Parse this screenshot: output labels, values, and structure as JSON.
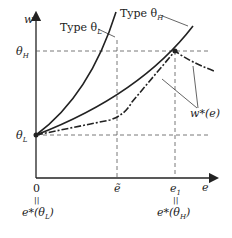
{
  "diagram": {
    "axes": {
      "y_label": "w",
      "x_label": "e",
      "origin_label": "0"
    },
    "y_ticks": [
      {
        "name": "theta-H",
        "symbol": "θ",
        "sub": "H"
      },
      {
        "name": "theta-L",
        "symbol": "θ",
        "sub": "L"
      }
    ],
    "x_ticks": [
      {
        "name": "zero",
        "label": "0",
        "equals": "||",
        "below": "e*(θ",
        "below_sub": "L",
        "below_close": ")"
      },
      {
        "name": "e-tilde",
        "label": "ẽ"
      },
      {
        "name": "e-1",
        "label": "e",
        "label_sub": "1",
        "equals": "||",
        "below": "e*(θ",
        "below_sub": "H",
        "below_close": ")"
      }
    ],
    "curves": [
      {
        "name": "type-theta-L",
        "label_prefix": "Type θ",
        "label_sub": "L",
        "style": "solid"
      },
      {
        "name": "type-theta-H",
        "label_prefix": "Type θ",
        "label_sub": "H",
        "style": "solid"
      },
      {
        "name": "w-star",
        "label": "w*(e)",
        "style": "dash-dot"
      }
    ],
    "colors": {
      "line": "#222222",
      "dash": "#555555"
    }
  }
}
